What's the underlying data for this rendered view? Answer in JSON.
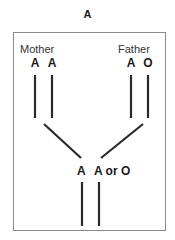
{
  "diagram": {
    "title": "A",
    "mother": {
      "label": "Mother",
      "alleles": [
        "A",
        "A"
      ]
    },
    "father": {
      "label": "Father",
      "alleles": [
        "A",
        "O"
      ]
    },
    "offspring": {
      "allele_1": "A",
      "allele_2": "A or O"
    },
    "colors": {
      "line": "#2a2a2a",
      "frame": "#8a8a8a",
      "text": "#1a1a1a"
    }
  }
}
